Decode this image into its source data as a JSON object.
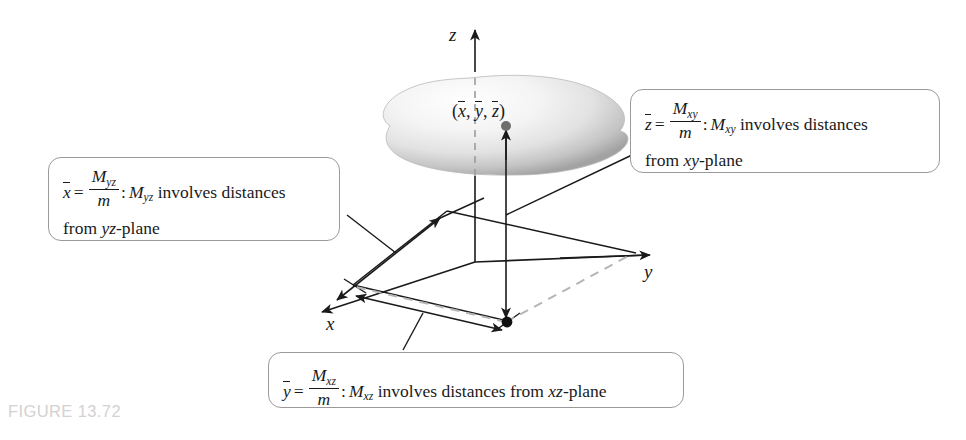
{
  "figure": {
    "caption": "FIGURE 13.72",
    "caption_color": "#d2d2d2",
    "background": "#ffffff",
    "line_color": "#1a1a1a",
    "dash_color": "#b5b5b5",
    "box_border_color": "#9a9a9a"
  },
  "axes": {
    "z_label": "z",
    "y_label": "y",
    "x_label": "x"
  },
  "centroid": {
    "label_open": "(",
    "label_x": "x",
    "sep1": ", ",
    "label_y": "y",
    "sep2": ", ",
    "label_z": "z",
    "label_close": ")",
    "label_plain": "(x̄, ȳ, z̄)"
  },
  "callouts": {
    "xbar": {
      "var": "x",
      "equals": "=",
      "numerator": "M",
      "numerator_sub": "yz",
      "denominator": "m",
      "colon": ":",
      "moment": "M",
      "moment_sub": "yz",
      "phrase": " involves distances",
      "line2_pre": "from ",
      "line2_plane": "yz",
      "line2_post": "-plane",
      "plain_text": "x̄ = M_yz / m : M_yz involves distances from yz-plane"
    },
    "zbar": {
      "var": "z",
      "equals": "=",
      "numerator": "M",
      "numerator_sub": "xy",
      "denominator": "m",
      "colon": ":",
      "moment": "M",
      "moment_sub": "xy",
      "phrase": " involves distances",
      "line2_pre": "from ",
      "line2_plane": "xy",
      "line2_post": "-plane",
      "plain_text": "z̄ = M_xy / m : M_xy involves distances from xy-plane"
    },
    "ybar": {
      "var": "y",
      "equals": "=",
      "numerator": "M",
      "numerator_sub": "xz",
      "denominator": "m",
      "colon": ":",
      "moment": "M",
      "moment_sub": "xz",
      "phrase": " involves distances from ",
      "plane": "xz",
      "post": "-plane",
      "plain_text": "ȳ = M_xz / m : M_xz involves distances from xz-plane"
    }
  }
}
